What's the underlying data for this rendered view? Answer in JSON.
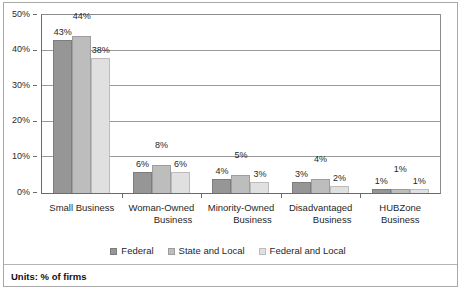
{
  "chart_data": {
    "type": "bar",
    "title": "",
    "xlabel": "",
    "ylabel": "",
    "ylim": [
      0,
      50
    ],
    "ytick_labels": [
      "0%",
      "10%",
      "20%",
      "30%",
      "40%",
      "50%"
    ],
    "yticks": [
      0,
      10,
      20,
      30,
      40,
      50
    ],
    "grid": "horizontal",
    "legend_position": "bottom",
    "units_note": "Units: % of firms",
    "categories": [
      "Small Business",
      "Woman-Owned Business",
      "Minority-Owned Business",
      "Disadvantaged Business",
      "HUBZone Business"
    ],
    "category_lines": [
      [
        "Small Business",
        ""
      ],
      [
        "Woman-Owned",
        "Business"
      ],
      [
        "Minority-Owned",
        "Business"
      ],
      [
        "Disadvantaged",
        "Business"
      ],
      [
        "HUBZone Business",
        ""
      ]
    ],
    "series": [
      {
        "name": "Federal",
        "color": "#969696",
        "values": [
          43,
          6,
          4,
          3,
          1
        ],
        "labels": [
          "43%",
          "6%",
          "4%",
          "3%",
          "1%"
        ]
      },
      {
        "name": "State and Local",
        "color": "#bdbdbd",
        "values": [
          44,
          8,
          5,
          4,
          1
        ],
        "labels": [
          "44%",
          "8%",
          "5%",
          "4%",
          "1%"
        ]
      },
      {
        "name": "Federal and Local",
        "color": "#e0e0e0",
        "values": [
          38,
          6,
          3,
          2,
          1
        ],
        "labels": [
          "38%",
          "6%",
          "3%",
          "2%",
          "1%"
        ]
      }
    ]
  },
  "footer": {
    "units": "Units: % of firms"
  },
  "axis": {
    "y": {
      "t0": "0%",
      "t1": "10%",
      "t2": "20%",
      "t3": "30%",
      "t4": "40%",
      "t5": "50%"
    }
  },
  "legend": {
    "items": [
      {
        "label": "Federal"
      },
      {
        "label": "State and Local"
      },
      {
        "label": "Federal and Local"
      }
    ]
  }
}
